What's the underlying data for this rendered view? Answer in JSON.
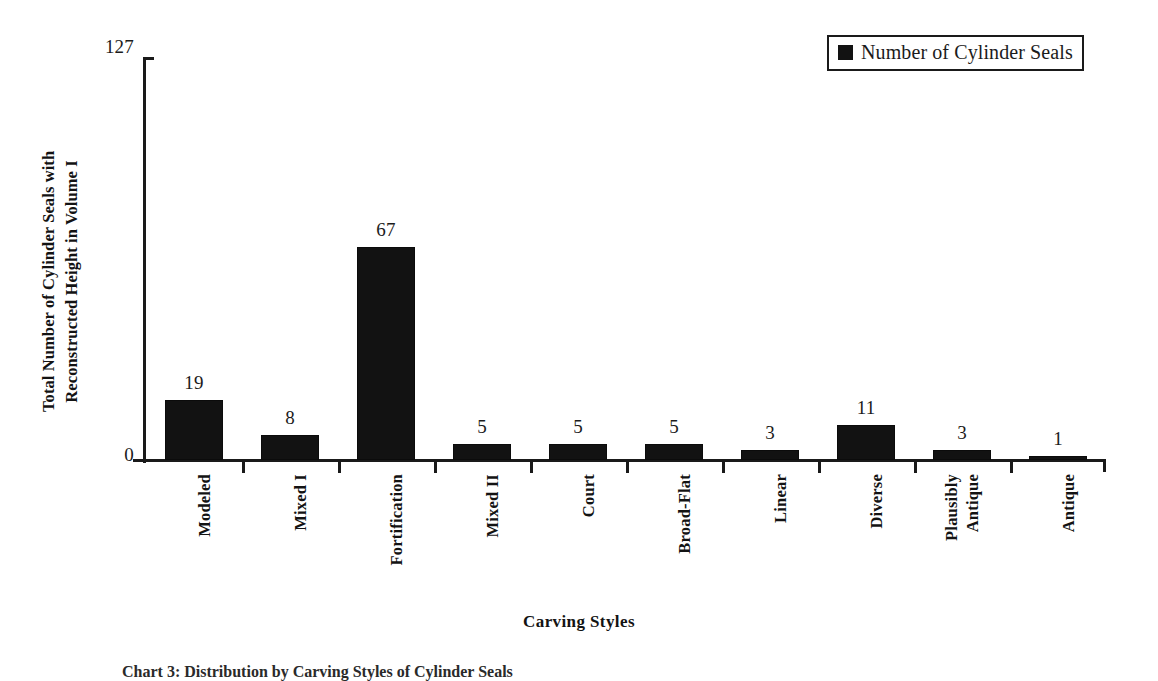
{
  "chart_data": {
    "type": "bar",
    "title": "",
    "xlabel": "Carving Styles",
    "ylabel": "Total Number of Cylinder Seals with\nReconstructed Height in Volume I",
    "categories": [
      "Modeled",
      "Mixed I",
      "Fortification",
      "Mixed II",
      "Court",
      "Broad-Flat",
      "Linear",
      "Diverse",
      "Plausibly\nAntique",
      "Antique"
    ],
    "values": [
      19,
      8,
      67,
      5,
      5,
      5,
      3,
      11,
      3,
      1
    ],
    "series": [
      {
        "name": "Number of Cylinder Seals",
        "values": [
          19,
          8,
          67,
          5,
          5,
          5,
          3,
          11,
          3,
          1
        ]
      }
    ],
    "ylim": [
      0,
      127
    ],
    "y_tick_labels": [
      "0",
      "127"
    ],
    "grid": false,
    "legend_position": "top-right",
    "bar_color": "#121212",
    "data_labels_shown": true
  },
  "axis": {
    "y_max_label": "127",
    "y_min_label": "0",
    "y_title": "Total Number of Cylinder Seals with\nReconstructed Height in Volume I",
    "x_title": "Carving Styles"
  },
  "legend": {
    "marker_color": "#121212",
    "label": "Number of Cylinder Seals"
  },
  "caption": {
    "text": "Chart 3: Distribution by Carving Styles of Cylinder Seals"
  }
}
